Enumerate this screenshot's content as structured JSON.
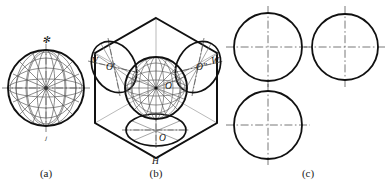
{
  "figure": {
    "panels": [
      {
        "id": "a",
        "caption": "(a)",
        "description": "Sphere drawn with meridian and parallel circles",
        "labels": {
          "top": "✻",
          "bottom": "ⱼ"
        }
      },
      {
        "id": "b",
        "caption": "(b)",
        "description": "Axonometric (isometric) hexagonal box with sphere and three elliptical projections",
        "plane_labels": {
          "v": "V",
          "h": "H",
          "w": "W"
        },
        "point_labels": {
          "front_ellipse": "O'",
          "center_sphere": "O",
          "side_ellipse": "O″",
          "bottom_ellipse": "O"
        }
      },
      {
        "id": "c",
        "caption": "(c)",
        "description": "Three orthographic views of the sphere, each a circle with dash-dot centrelines",
        "views": [
          {
            "name": "front-view",
            "cx": 268,
            "cy": 47,
            "r": 34
          },
          {
            "name": "side-view",
            "cx": 345,
            "cy": 47,
            "r": 33
          },
          {
            "name": "top-view",
            "cx": 268,
            "cy": 125,
            "r": 34
          }
        ]
      }
    ],
    "colors": {
      "outline": "#111111",
      "thin": "#4d4d4d",
      "centerline": "#555555",
      "caption": "#1a1a1a"
    }
  }
}
